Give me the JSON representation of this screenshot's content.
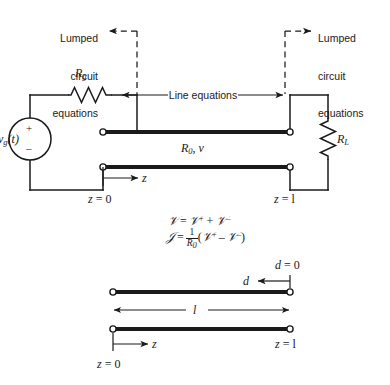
{
  "figure": {
    "title_present": false,
    "colors": {
      "ink": "#1a1a1a",
      "background": "#ffffff"
    },
    "callouts": {
      "left": {
        "line1": "Lumped",
        "line2": "circuit",
        "line3": "equations",
        "arrow": "left-pointing-dashed-arrow"
      },
      "right": {
        "line1": "Lumped",
        "line2": "circuit",
        "line3": "equations",
        "arrow": "right-pointing-dashed-arrow"
      }
    },
    "line_equations_label": "Line equations",
    "source": {
      "label_v": "v",
      "label_v_sub": "g",
      "label_v_arg": "(t)",
      "polarity_plus": "+",
      "polarity_minus": "–"
    },
    "resistors": {
      "series": {
        "symbol": "R",
        "sub": "g"
      },
      "load": {
        "symbol": "R",
        "sub": "L"
      }
    },
    "line_params": {
      "symbol": "R",
      "sub": "0",
      "velocity": "v",
      "separator": ", "
    },
    "coords_main": {
      "left": {
        "var": "z",
        "eq": " = 0"
      },
      "right": {
        "var": "z",
        "eq": " = l"
      },
      "axis_arrow_label": "z"
    },
    "equations": {
      "eq1": {
        "lhs": "𝒱",
        "eq": "=",
        "t1": "𝒱",
        "t1_sup": "+",
        "plus": "+",
        "t2": "𝒱",
        "t2_sup": "–"
      },
      "eq2": {
        "lhs": "𝒥",
        "eq": "=",
        "frac_num": "1",
        "frac_den_sym": "R",
        "frac_den_sub": "0",
        "open": "(",
        "t1": "𝒱",
        "t1_sup": "+",
        "minus": "–",
        "t2": "𝒱",
        "t2_sup": "–",
        "close": ")"
      }
    },
    "bottom_diagram": {
      "d_zero_label": {
        "var": "d",
        "eq": " = 0"
      },
      "d_axis_label": "d",
      "length_label": "l",
      "z_axis_label": "z",
      "z_zero_label": {
        "var": "z",
        "eq": " = 0"
      },
      "z_end_label": {
        "var": "z",
        "eq": " = l"
      }
    }
  }
}
